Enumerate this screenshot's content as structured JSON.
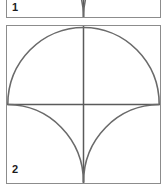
{
  "sheet": {
    "title": "Geometric figure sheet",
    "background_color": "#ffffff"
  },
  "style": {
    "panel_border_color": "#8c8c8c",
    "arc_color": "#6a6a6a",
    "axis_color": "#5a5a5a",
    "label_color": "#1c1c1c",
    "fill_color": "#ffffff"
  },
  "figures": [
    {
      "label": "1",
      "caption": "",
      "clipped": true,
      "description": "Square panel, partially cut off at the top of the image; only the lower portion is visible showing two concave arcs meeting at the bottom-centre and a vertical centre line.",
      "geometry": {
        "frame": "square",
        "vertical_midline": true,
        "horizontal_midline": true,
        "top_half": "semicircle spanning the full width, centred on the horizontal midline",
        "bottom_half": "two quarter-circle arcs, each of radius equal to half the square side, convex toward the outer corners, meeting tangentially at the bottom-centre point"
      }
    },
    {
      "label": "2",
      "caption": "",
      "clipped": false,
      "description": "Square panel with a horizontal midline and a vertical midline. A large semicircle occupies the upper half, spanning the full width with its diameter on the horizontal midline. In the lower half two quarter-circle arcs sweep from the left and right ends of the horizontal midline down to the bottom-centre, where they meet tangent to the vertical midline.",
      "geometry": {
        "frame": "square",
        "vertical_midline": true,
        "horizontal_midline": true,
        "top_half": "semicircle spanning the full width, centred on the horizontal midline",
        "bottom_half": "two quarter-circle arcs, each of radius equal to half the square side, convex toward the outer corners, meeting tangentially at the bottom-centre point"
      }
    }
  ]
}
